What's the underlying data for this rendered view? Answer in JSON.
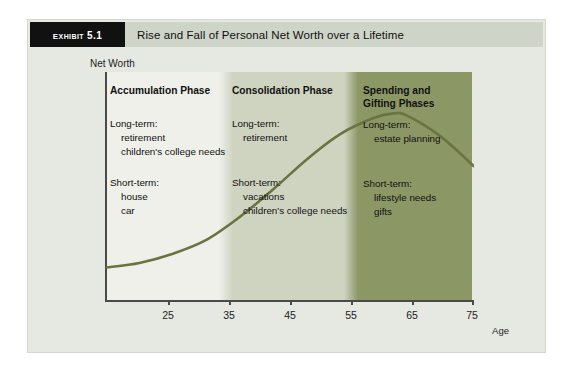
{
  "exhibit": {
    "tab_label": "Exhibit 5.1",
    "title": "Rise and Fall of Personal Net Worth over a Lifetime"
  },
  "chart_data": {
    "type": "line",
    "title": "Rise and Fall of Personal Net Worth over a Lifetime",
    "xlabel": "Age",
    "ylabel": "Net Worth",
    "xlim": [
      20,
      75
    ],
    "ylim": [
      0,
      100
    ],
    "grid": false,
    "legend": "none",
    "xticks": [
      "25",
      "35",
      "45",
      "55",
      "65",
      "75"
    ],
    "xtick_values": [
      25,
      35,
      45,
      55,
      65,
      75
    ],
    "yticks": [],
    "series": [
      {
        "name": "Personal Net Worth",
        "color": "#6b7340",
        "x": [
          20,
          25,
          30,
          35,
          40,
          45,
          50,
          55,
          60,
          63,
          65,
          70,
          75
        ],
        "values": [
          15,
          17,
          21,
          27,
          37,
          49,
          62,
          73,
          80,
          82,
          81,
          72,
          59
        ]
      }
    ],
    "bands": [
      {
        "label": "Accumulation Phase",
        "x_start": 20,
        "x_end": 37,
        "color": "#eef0e9"
      },
      {
        "label": "Consolidation Phase",
        "x_start": 37,
        "x_end": 56,
        "color": "#cfd4c1"
      },
      {
        "label": "Spending and Gifting Phases",
        "x_start": 56,
        "x_end": 75,
        "color": "#8c9766"
      }
    ],
    "annotations": [
      {
        "phase": "Accumulation Phase",
        "long_term_label": "Long-term:",
        "long_term_items": [
          "retirement",
          "children's college needs"
        ],
        "short_term_label": "Short-term:",
        "short_term_items": [
          "house",
          "car"
        ]
      },
      {
        "phase": "Consolidation Phase",
        "long_term_label": "Long-term:",
        "long_term_items": [
          "retirement"
        ],
        "short_term_label": "Short-term:",
        "short_term_items": [
          "vacations",
          "children's college needs"
        ]
      },
      {
        "phase": "Spending and Gifting Phases",
        "long_term_label": "Long-term:",
        "long_term_items": [
          "estate planning"
        ],
        "short_term_label": "Short-term:",
        "short_term_items": [
          "lifestyle needs",
          "gifts"
        ]
      }
    ]
  },
  "phases": [
    {
      "heading_line1": "Accumulation Phase",
      "heading_line2": "",
      "long_term_label": "Long-term:",
      "long_1": "retirement",
      "long_2": "children's college needs",
      "short_term_label": "Short-term:",
      "short_1": "house",
      "short_2": "car"
    },
    {
      "heading_line1": "Consolidation Phase",
      "heading_line2": "",
      "long_term_label": "Long-term:",
      "long_1": "retirement",
      "long_2": "",
      "short_term_label": "Short-term:",
      "short_1": "vacations",
      "short_2": "children's college needs"
    },
    {
      "heading_line1": "Spending and",
      "heading_line2": "Gifting Phases",
      "long_term_label": "Long-term:",
      "long_1": "estate planning",
      "long_2": "",
      "short_term_label": "Short-term:",
      "short_1": "lifestyle needs",
      "short_2": "gifts"
    }
  ],
  "axis": {
    "y_title": "Net Worth",
    "x_title": "Age",
    "tick_25": "25",
    "tick_35": "35",
    "tick_45": "45",
    "tick_55": "55",
    "tick_65": "65",
    "tick_75": "75"
  },
  "colors": {
    "panel_bg": "#e6e9e2",
    "header_bg": "#cfd4c8",
    "tab_bg": "#111111",
    "band_light": "#eef0e9",
    "band_mid": "#cfd4c1",
    "band_dark": "#8c9766",
    "curve": "#6b7340",
    "axis": "#4a4a4a"
  }
}
